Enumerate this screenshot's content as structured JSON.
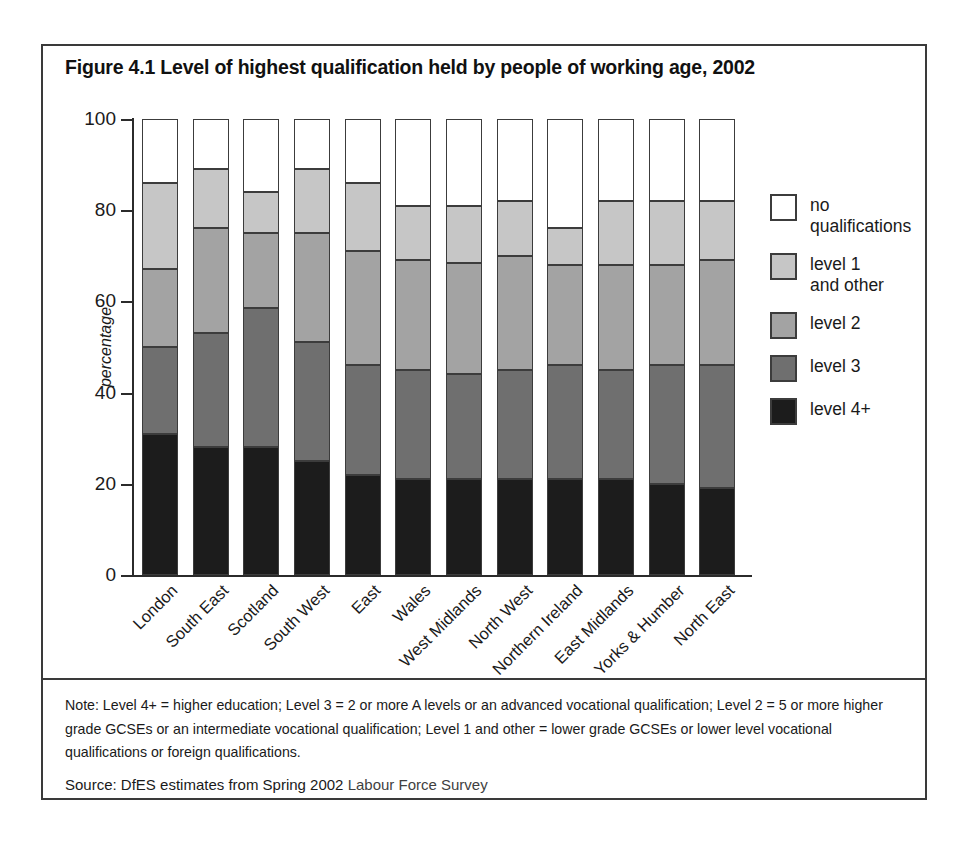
{
  "figure": {
    "title": "Figure 4.1 Level of highest qualification held by people of working age, 2002",
    "note": "Note: Level 4+ = higher education; Level 3 = 2 or more A levels or an advanced vocational qualification; Level 2 = 5 or more higher grade GCSEs or an intermediate vocational qualification; Level 1 and other = lower grade GCSEs or lower level vocational qualifications or foreign qualifications.",
    "source_prefix": "Source: DfES estimates from Spring 2002 ",
    "source_italic": "Labour Force Survey"
  },
  "legend": {
    "items": [
      {
        "key": "noq",
        "label": "no\nqualifications",
        "color": "#ffffff"
      },
      {
        "key": "l1",
        "label": "level 1\nand other",
        "color": "#c6c6c6"
      },
      {
        "key": "l2",
        "label": "level 2",
        "color": "#a3a3a3"
      },
      {
        "key": "l3",
        "label": "level 3",
        "color": "#6f6f6f"
      },
      {
        "key": "l4",
        "label": "level 4+",
        "color": "#1c1c1c"
      }
    ]
  },
  "chart_data": {
    "type": "bar",
    "subtype": "stacked-percentage-column",
    "title": "Figure 4.1 Level of highest qualification held by people of working age, 2002",
    "xlabel": "",
    "ylabel": "percentage",
    "ylim": [
      0,
      100
    ],
    "yticks": [
      0,
      20,
      40,
      60,
      80,
      100
    ],
    "grid": false,
    "legend_position": "right",
    "categories": [
      "London",
      "South East",
      "Scotland",
      "South West",
      "East",
      "Wales",
      "West Midlands",
      "North West",
      "Northern Ireland",
      "East Midlands",
      "Yorks & Humber",
      "North East"
    ],
    "series": [
      {
        "name": "level 4+",
        "key": "l4",
        "color": "#1c1c1c",
        "values": [
          31,
          28,
          28,
          25,
          22,
          21,
          21,
          21,
          21,
          21,
          20,
          19
        ]
      },
      {
        "name": "level 3",
        "key": "l3",
        "color": "#6f6f6f",
        "values": [
          19,
          25,
          30.5,
          26,
          24,
          24,
          23,
          24,
          25,
          24,
          26,
          27
        ]
      },
      {
        "name": "level 2",
        "key": "l2",
        "color": "#a3a3a3",
        "values": [
          17,
          23,
          16.5,
          24,
          25,
          24,
          24.5,
          25,
          22,
          23,
          22,
          23
        ]
      },
      {
        "name": "level 1 and other",
        "key": "l1",
        "color": "#c6c6c6",
        "values": [
          19,
          13,
          9,
          14,
          15,
          12,
          12.5,
          12,
          8,
          14,
          14,
          13
        ]
      },
      {
        "name": "no qualifications",
        "key": "noq",
        "color": "#ffffff",
        "values": [
          14,
          11,
          16,
          11,
          14,
          19,
          19,
          18,
          24,
          18,
          18,
          18
        ]
      }
    ],
    "cumulative_tops": {
      "level 4+": [
        31,
        28,
        28,
        25,
        22,
        21,
        21,
        21,
        21,
        21,
        20,
        19
      ],
      "level 3": [
        50,
        53,
        58.5,
        51,
        46,
        45,
        44,
        45,
        46,
        45,
        46,
        46
      ],
      "level 2": [
        67,
        76,
        75,
        75,
        71,
        69,
        68.5,
        70,
        68,
        68,
        68,
        69
      ],
      "level 1 and other": [
        86,
        89,
        84,
        89,
        86,
        81,
        81,
        82,
        76,
        82,
        82,
        82
      ],
      "no qualifications": [
        100,
        100,
        100,
        100,
        100,
        100,
        100,
        100,
        100,
        100,
        100,
        100
      ]
    }
  }
}
